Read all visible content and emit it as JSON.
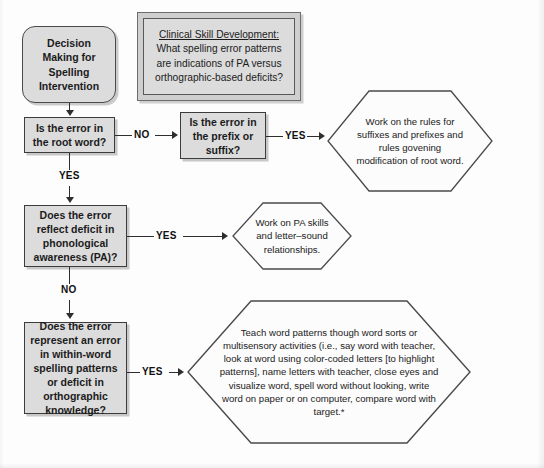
{
  "diagram": {
    "colors": {
      "node_fill": "#dcdcdc",
      "callout_frame": "#cfcfcf",
      "hexagon_fill": "#fcfcfc",
      "stroke": "#3c3c3c",
      "background": "#fdfdfd"
    }
  },
  "nodes": {
    "start": {
      "label": "Decision Making for Spelling Intervention",
      "shape": "rounded-rectangle"
    },
    "callout": {
      "heading": "Clinical Skill Development:",
      "body": "What spelling error patterns are indications of PA versus orthographic-based deficits?",
      "shape": "double-framed-box"
    },
    "decision_root": {
      "label": "Is the error in the root word?",
      "shape": "rectangle"
    },
    "decision_affix": {
      "label": "Is the error in the prefix or suffix?",
      "shape": "rectangle"
    },
    "decision_pa": {
      "label": "Does the error reflect deficit in phonological awareness (PA)?",
      "shape": "rectangle"
    },
    "decision_ortho": {
      "label": "Does the error represent an error in within-word spelling patterns or deficit in orthographic knowledge?",
      "shape": "rectangle"
    },
    "outcome_affix": {
      "label": "Work on the rules for suffixes and prefixes and rules govening modification of root word.",
      "shape": "hexagon"
    },
    "outcome_pa": {
      "label": "Work on PA skills and letter–sound relationships.",
      "shape": "hexagon"
    },
    "outcome_ortho": {
      "label": "Teach word patterns though word sorts or multisensory activities (i.e., say word with teacher, look at word using color-coded letters [to highlight patterns], name letters with teacher, close eyes and visualize word, spell word without looking, write word on paper or on computer, compare word with target.*",
      "shape": "hexagon"
    }
  },
  "edges": {
    "start_to_root": "",
    "root_no": "NO",
    "root_yes": "YES",
    "affix_yes": "YES",
    "pa_yes": "YES",
    "pa_no": "NO",
    "ortho_yes": "YES"
  }
}
